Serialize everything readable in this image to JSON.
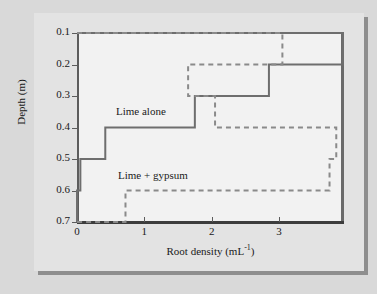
{
  "chart_data": {
    "type": "line",
    "title": "",
    "xlabel": "Root density (mL",
    "xlabel_sup": "-1",
    "xlabel_tail": ")",
    "ylabel": "Depth (m)",
    "xlim": [
      0,
      3.95
    ],
    "ylim": [
      0.1,
      0.7
    ],
    "y_inverted": true,
    "grid": false,
    "legend_position": "inline-annotation",
    "xticks": [
      0,
      1,
      2,
      3
    ],
    "xticklabels": [
      "0",
      "1",
      "2",
      "3"
    ],
    "yticks": [
      0.1,
      0.2,
      0.3,
      0.4,
      0.5,
      0.6,
      0.7
    ],
    "yticklabels": [
      "0.1",
      "0.2",
      "0.3",
      "0.4",
      "0.5",
      "0.6",
      "0.7"
    ],
    "depth_bins": [
      [
        0.1,
        0.2
      ],
      [
        0.2,
        0.3
      ],
      [
        0.3,
        0.4
      ],
      [
        0.4,
        0.5
      ],
      [
        0.5,
        0.6
      ],
      [
        0.6,
        0.7
      ]
    ],
    "series": [
      {
        "name": "Lime alone",
        "style": "solid",
        "color": "#6e6e6e",
        "values": [
          3.95,
          2.85,
          1.75,
          0.42,
          0.05,
          0.0
        ]
      },
      {
        "name": "Lime + gypsum",
        "style": "dashed",
        "color": "#8a8a8a",
        "values": [
          3.05,
          1.65,
          2.05,
          3.85,
          3.75,
          0.72
        ]
      }
    ]
  },
  "labels": {
    "series_lime_alone": "Lime alone",
    "series_lime_gypsum": "Lime + gypsum"
  },
  "colors": {
    "page_background": "#d9d9d9",
    "card_background": "#e3e3e3",
    "plot_background": "#f2f2f2",
    "axis": "#3d3d3d",
    "solid_series": "#6e6e6e",
    "dashed_series": "#8a8a8a",
    "text": "#1a1a1a"
  }
}
